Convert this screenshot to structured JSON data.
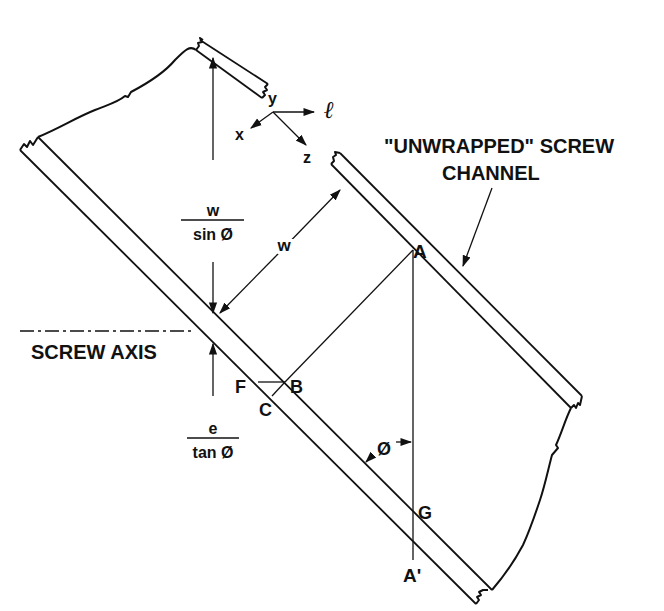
{
  "diagram": {
    "type": "technical-figure",
    "colors": {
      "ink": "#111111",
      "background": "#ffffff"
    },
    "coordinate_axes": {
      "y": "y",
      "l": "ℓ",
      "x": "x",
      "z": "z"
    },
    "labels": {
      "channel_title_line1": "\"UNWRAPPED\" SCREW",
      "channel_title_line2": "CHANNEL",
      "screw_axis": "SCREW AXIS",
      "w_over_sin_num": "w",
      "w_over_sin_den": "sin Ø",
      "w_width": "w",
      "e_over_tan_num": "e",
      "e_over_tan_den": "tan Ø",
      "angle": "Ø"
    },
    "points": {
      "A": "A",
      "A_prime": "A'",
      "B": "B",
      "C": "C",
      "F": "F",
      "G": "G"
    }
  }
}
